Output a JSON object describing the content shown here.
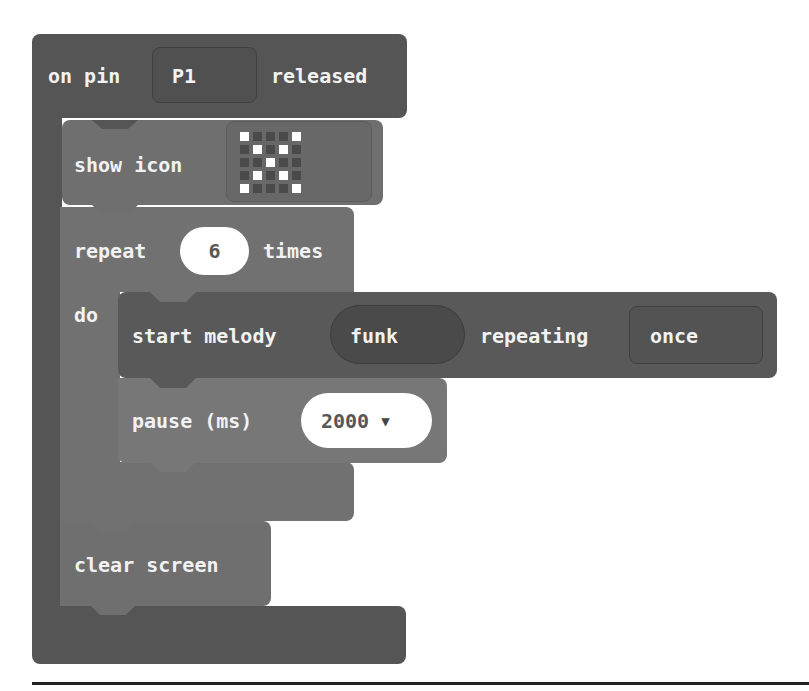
{
  "colors": {
    "event_block": "#555555",
    "basic_block": "#6f6f6f",
    "loop_block": "#717171",
    "music_block": "#595959",
    "field_bg": "#ffffff",
    "text": "#f2f2f2"
  },
  "event_block": {
    "prefix": "on pin",
    "pin_value": "P1",
    "suffix": "released"
  },
  "show_icon_block": {
    "label": "show icon",
    "icon_name": "x-pattern-icon",
    "led_grid": [
      [
        1,
        0,
        0,
        0,
        1
      ],
      [
        0,
        1,
        0,
        1,
        0
      ],
      [
        0,
        0,
        1,
        0,
        0
      ],
      [
        0,
        1,
        0,
        1,
        0
      ],
      [
        1,
        0,
        0,
        0,
        1
      ]
    ]
  },
  "repeat_block": {
    "prefix": "repeat",
    "count": "6",
    "suffix": "times",
    "do_label": "do"
  },
  "melody_block": {
    "prefix": "start melody",
    "melody": "funk",
    "middle": "repeating",
    "repeat_option": "once"
  },
  "pause_block": {
    "label": "pause (ms)",
    "value": "2000",
    "dropdown_icon": "▼"
  },
  "clear_screen_block": {
    "label": "clear screen"
  }
}
